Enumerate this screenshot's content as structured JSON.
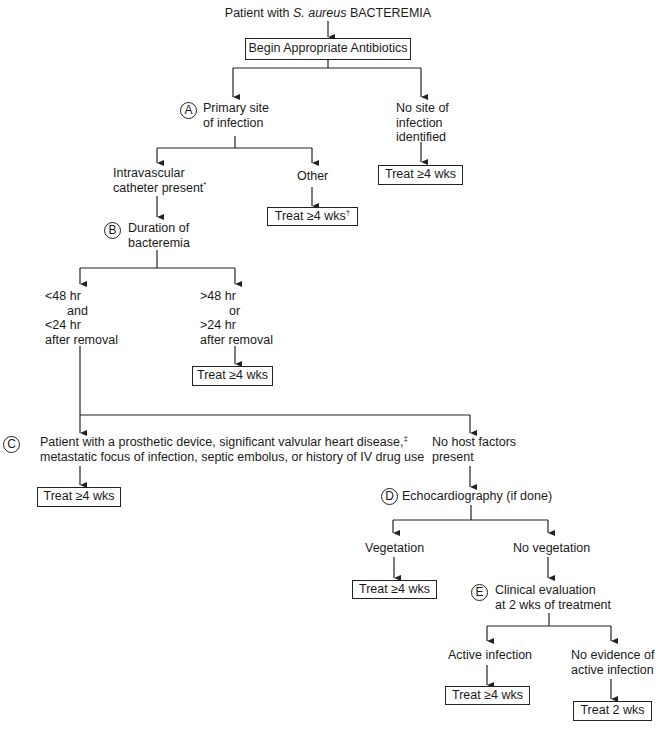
{
  "flowchart": {
    "start": {
      "prefix": "Patient with ",
      "organism": "S. aureus",
      "suffix": " BACTEREMIA"
    },
    "step1": "Begin Appropriate Antibiotics",
    "node_a": {
      "marker": "A",
      "line1": "Primary site",
      "line2": "of infection"
    },
    "no_site": {
      "line1": "No site of",
      "line2": "infection",
      "line3": "identified",
      "outcome": "Treat ≥4 wks"
    },
    "catheter": {
      "line1": "Intravascular",
      "line2": "catheter present",
      "footnote": "*"
    },
    "other": {
      "label": "Other",
      "outcome": "Treat ≥4 wks",
      "footnote": "†"
    },
    "node_b": {
      "marker": "B",
      "line1": "Duration of",
      "line2": "bacteremia"
    },
    "short_duration": {
      "line1": "<48 hr",
      "line2": "and",
      "line3": "<24 hr",
      "line4": "after removal"
    },
    "long_duration": {
      "line1": ">48 hr",
      "line2": "or",
      "line3": ">24 hr",
      "line4": "after removal",
      "outcome": "Treat ≥4 wks"
    },
    "node_c": {
      "marker": "C",
      "line1": "Patient with a prosthetic device, significant valvular heart disease,",
      "footnote": "‡",
      "line2": "metastatic focus of infection, septic embolus, or history of IV drug use",
      "outcome": "Treat ≥4 wks"
    },
    "no_host": {
      "line1": "No host factors",
      "line2": "present"
    },
    "node_d": {
      "marker": "D",
      "label": "Echocardiography (if done)"
    },
    "vegetation": {
      "label": "Vegetation",
      "outcome": "Treat ≥4 wks"
    },
    "no_vegetation": {
      "label": "No vegetation"
    },
    "node_e": {
      "marker": "E",
      "line1": "Clinical evaluation",
      "line2": "at 2 wks of treatment"
    },
    "active": {
      "label": "Active infection",
      "outcome": "Treat ≥4 wks"
    },
    "no_active": {
      "line1": "No evidence of",
      "line2": "active infection",
      "outcome": "Treat 2 wks"
    }
  },
  "colors": {
    "line": "#222222",
    "text": "#1a1a1a",
    "background": "#ffffff"
  }
}
